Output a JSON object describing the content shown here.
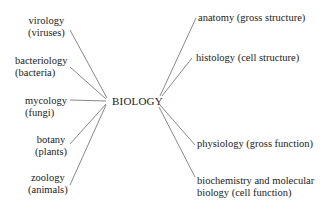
{
  "diagram": {
    "center": {
      "label": "BIOLOGY"
    },
    "left_branches": [
      {
        "line1": "virology",
        "line2": "(viruses)"
      },
      {
        "line1": "bacteriology",
        "line2": "(bacteria)"
      },
      {
        "line1": "mycology",
        "line2": "(fungi)"
      },
      {
        "line1": "botany",
        "line2": "(plants)"
      },
      {
        "line1": "zoology",
        "line2": "(animals)"
      }
    ],
    "right_branches": [
      {
        "line1": "anatomy (gross structure)",
        "line2": ""
      },
      {
        "line1": "histology (cell structure)",
        "line2": ""
      },
      {
        "line1": "physiology (gross function)",
        "line2": ""
      },
      {
        "line1": "biochemistry and molecular",
        "line2": "biology (cell function)"
      }
    ],
    "line_color": "#6a6a6a",
    "text_color": "#1a1a1a"
  }
}
